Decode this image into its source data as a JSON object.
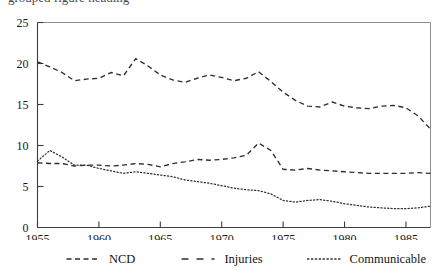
{
  "figure": {
    "name": "mortality-rate-trend-chart",
    "clipped_caption_fragment": "grouped figure heading",
    "line_color": "#2e2e2e",
    "axis_color": "#3d3d3d",
    "frame_color": "#8e8e8e"
  },
  "legend": {
    "position": "bottom",
    "entries": [
      {
        "label": "NCD",
        "dash": "dashed",
        "icon": "dashed-line-icon"
      },
      {
        "label": "Injuries",
        "dash": "long-dashed",
        "icon": "long-dashed-line-icon"
      },
      {
        "label": "Communicable",
        "dash": "dotted",
        "icon": "dotted-line-icon"
      }
    ]
  },
  "chart_data": {
    "type": "line",
    "title": "",
    "subtitle": "",
    "xlabel": "",
    "ylabel": "",
    "xlim": [
      1955,
      1987
    ],
    "ylim": [
      0,
      25
    ],
    "grid": false,
    "legend_position": "bottom",
    "x_ticks": [
      1955,
      1960,
      1965,
      1970,
      1975,
      1980,
      1985
    ],
    "x_tick_labels": [
      "1955",
      "1960",
      "1965",
      "1970",
      "1975",
      "1980",
      "1985"
    ],
    "y_ticks": [
      0,
      5,
      10,
      15,
      20,
      25
    ],
    "y_tick_labels": [
      "0",
      "5",
      "10",
      "15",
      "20",
      "25"
    ],
    "x": [
      1955,
      1956,
      1957,
      1958,
      1959,
      1960,
      1961,
      1962,
      1963,
      1964,
      1965,
      1966,
      1967,
      1968,
      1969,
      1970,
      1971,
      1972,
      1973,
      1974,
      1975,
      1976,
      1977,
      1978,
      1979,
      1980,
      1981,
      1982,
      1983,
      1984,
      1985,
      1986,
      1987
    ],
    "series": [
      {
        "name": "NCD",
        "dash": "dashed",
        "values": [
          20.2,
          19.6,
          18.9,
          17.9,
          18.1,
          18.2,
          18.9,
          18.5,
          20.6,
          19.7,
          18.6,
          18.0,
          17.7,
          18.2,
          18.6,
          18.3,
          17.9,
          18.2,
          19.0,
          17.8,
          16.5,
          15.5,
          14.8,
          14.7,
          15.3,
          14.8,
          14.6,
          14.5,
          14.8,
          14.9,
          14.6,
          13.6,
          12.0
        ]
      },
      {
        "name": "Injuries",
        "dash": "long-dashed",
        "values": [
          7.9,
          7.8,
          7.8,
          7.5,
          7.6,
          7.6,
          7.5,
          7.6,
          7.8,
          7.7,
          7.4,
          7.8,
          8.0,
          8.3,
          8.2,
          8.3,
          8.5,
          8.8,
          10.3,
          9.4,
          7.1,
          7.0,
          7.2,
          7.0,
          6.9,
          6.8,
          6.7,
          6.6,
          6.6,
          6.6,
          6.6,
          6.7,
          6.6
        ]
      },
      {
        "name": "Communicable",
        "dash": "dotted",
        "values": [
          8.1,
          9.4,
          8.6,
          7.6,
          7.6,
          7.2,
          6.9,
          6.6,
          6.8,
          6.6,
          6.4,
          6.2,
          5.8,
          5.6,
          5.4,
          5.1,
          4.8,
          4.6,
          4.5,
          4.1,
          3.3,
          3.1,
          3.3,
          3.4,
          3.2,
          2.9,
          2.7,
          2.5,
          2.4,
          2.3,
          2.3,
          2.4,
          2.6
        ]
      }
    ]
  }
}
